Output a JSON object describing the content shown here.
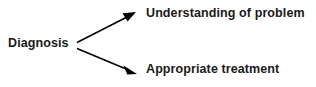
{
  "diagram": {
    "type": "flow-diagram",
    "background_color": "#ffffff",
    "text_color": "#1a1a1a",
    "arrow_color": "#000000",
    "source": {
      "label": "Diagnosis"
    },
    "targets": [
      {
        "label": "Understanding of problem"
      },
      {
        "label": "Appropriate treatment"
      }
    ],
    "edges": [
      {
        "from": "Diagnosis",
        "to": "Understanding of problem",
        "direction": "up-right",
        "arrowhead": "filled-triangle"
      },
      {
        "from": "Diagnosis",
        "to": "Appropriate treatment",
        "direction": "down-right",
        "arrowhead": "filled-triangle"
      }
    ]
  }
}
